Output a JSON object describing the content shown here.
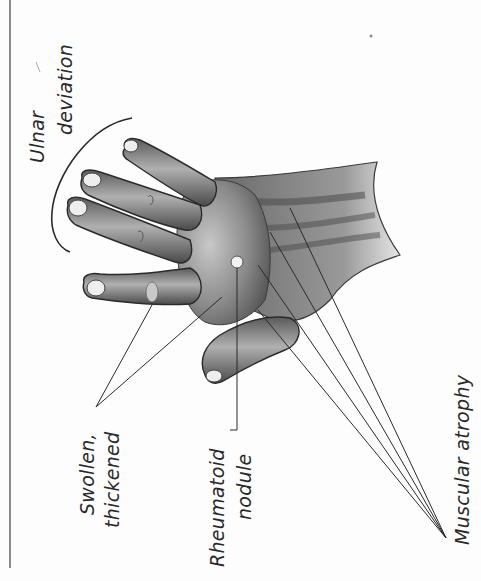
{
  "figure": {
    "colors": {
      "background": "#fdfdfd",
      "ink": "#2a2a2a",
      "border": "#8a8a8a",
      "skin_dark": "#4a4a4a",
      "skin_mid": "#8c8c8c",
      "skin_light": "#d6d6d6"
    },
    "labels": {
      "ulnar_line1": "Ulnar",
      "ulnar_line2": "deviation",
      "swollen_line1": "Swollen,",
      "swollen_line2": "thickened",
      "nodule_line1": "Rheumatoid",
      "nodule_line2": "nodule",
      "atrophy": "Muscular atrophy"
    }
  }
}
